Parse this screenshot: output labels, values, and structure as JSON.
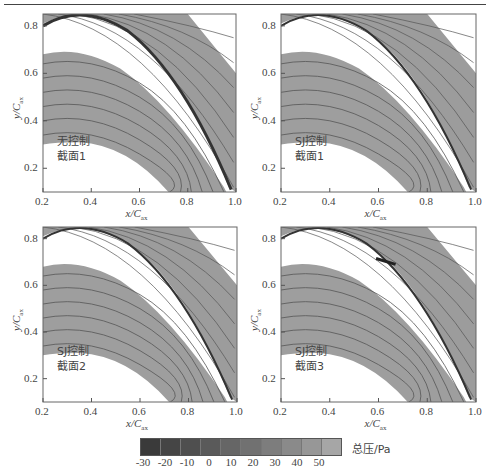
{
  "chart_data": [
    {
      "type": "heatmap",
      "panel": "top-left",
      "title": "",
      "annotation": [
        "无控制",
        "截面1"
      ],
      "xlabel": "x/Cax",
      "ylabel": "y/Cax",
      "xlim": [
        0.2,
        1.0
      ],
      "ylim": [
        0.1,
        0.85
      ],
      "xticks": [
        "0.2",
        "0.4",
        "0.6",
        "0.8",
        "1.0"
      ],
      "yticks": [
        "0.2",
        "0.4",
        "0.6",
        "0.8"
      ],
      "jet_visible": false
    },
    {
      "type": "heatmap",
      "panel": "top-right",
      "annotation": [
        "SJ控制",
        "截面1"
      ],
      "xlabel": "x/Cax",
      "ylabel": "y/Cax",
      "xlim": [
        0.2,
        1.0
      ],
      "ylim": [
        0.1,
        0.85
      ],
      "xticks": [
        "0.2",
        "0.4",
        "0.6",
        "0.8",
        "1.0"
      ],
      "yticks": [
        "0.2",
        "0.4",
        "0.6",
        "0.8"
      ],
      "jet_visible": false
    },
    {
      "type": "heatmap",
      "panel": "bottom-left",
      "annotation": [
        "SJ控制",
        "截面2"
      ],
      "xlabel": "x/Cax",
      "ylabel": "y/Cax",
      "xlim": [
        0.2,
        1.0
      ],
      "ylim": [
        0.1,
        0.85
      ],
      "xticks": [
        "0.2",
        "0.4",
        "0.6",
        "0.8",
        "1.0"
      ],
      "yticks": [
        "0.2",
        "0.4",
        "0.6",
        "0.8"
      ],
      "jet_visible": false
    },
    {
      "type": "heatmap",
      "panel": "bottom-right",
      "annotation": [
        "SJ控制",
        "截面3"
      ],
      "xlabel": "x/Cax",
      "ylabel": "y/Cax",
      "xlim": [
        0.2,
        1.0
      ],
      "ylim": [
        0.1,
        0.85
      ],
      "xticks": [
        "0.2",
        "0.4",
        "0.6",
        "0.8",
        "1.0"
      ],
      "yticks": [
        "0.2",
        "0.4",
        "0.6",
        "0.8"
      ],
      "jet_visible": true
    }
  ],
  "colorbar": {
    "title": "总压/Pa",
    "ticks": [
      "-30",
      "-20",
      "-10",
      "0",
      "10",
      "20",
      "30",
      "40",
      "50"
    ],
    "colors": [
      "#3a3a3a",
      "#454545",
      "#4f4f4f",
      "#5a5a5a",
      "#666666",
      "#717171",
      "#7d7d7d",
      "#8a8a8a",
      "#979797",
      "#a6a6a6"
    ]
  },
  "axes": {
    "xlabel_main": "x/C",
    "xlabel_sub": "ax",
    "ylabel_main": "y/C",
    "ylabel_sub": "ax"
  },
  "annotations": {
    "p1_line1": "无控制",
    "p1_line2": "截面1",
    "p2_line1": "SJ控制",
    "p2_line2": "截面1",
    "p3_line1": "SJ控制",
    "p3_line2": "截面2",
    "p4_line1": "SJ控制",
    "p4_line2": "截面3"
  },
  "ticks": {
    "x": [
      "0.2",
      "0.4",
      "0.6",
      "0.8",
      "1.0"
    ],
    "y": [
      "0.2",
      "0.4",
      "0.6",
      "0.8"
    ]
  }
}
